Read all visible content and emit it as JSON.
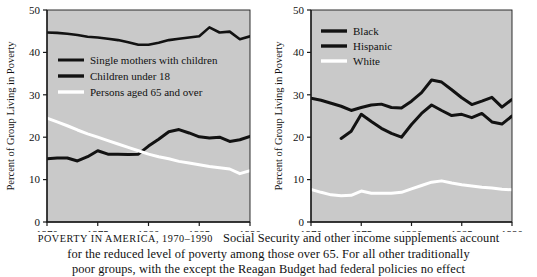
{
  "caption": {
    "title": "Poverty in America, 1970–1990",
    "line1_rest": "Social Security and other income supplements account",
    "line2": "for the reduced level of poverty among those over 65. For all other traditionally",
    "line3": "poor groups, with the except the Reagan Budget had federal policies no effect"
  },
  "colors": {
    "plot_background": "#c9c9c9",
    "axis": "#1a1a1a",
    "dark_series": "#121212",
    "light_series": "#ffffff",
    "page_background": "#ffffff"
  },
  "chart_data": [
    {
      "id": "left",
      "type": "line",
      "title": "",
      "xlabel": "",
      "ylabel": "Percent of Group Living in Poverty",
      "xlim": [
        1970,
        1990
      ],
      "ylim": [
        0,
        50
      ],
      "xticks": [
        1970,
        1975,
        1980,
        1985,
        1990
      ],
      "yticks": [
        0,
        10,
        20,
        30,
        40,
        50
      ],
      "grid": false,
      "legend_position": "upper-left-inside",
      "series": [
        {
          "name": "Single mothers with children",
          "color": "#121212",
          "width": 2.6,
          "x": [
            1970,
            1971,
            1972,
            1973,
            1974,
            1975,
            1976,
            1977,
            1978,
            1979,
            1980,
            1981,
            1982,
            1983,
            1984,
            1985,
            1986,
            1987,
            1988,
            1989,
            1990
          ],
          "values": [
            44.7,
            44.6,
            44.4,
            44.1,
            43.7,
            43.5,
            43.2,
            42.9,
            42.4,
            41.8,
            41.8,
            42.3,
            42.9,
            43.2,
            43.5,
            43.8,
            45.9,
            44.7,
            44.9,
            43.1,
            43.8
          ]
        },
        {
          "name": "Children under 18",
          "color": "#121212",
          "width": 3.0,
          "x": [
            1970,
            1971,
            1972,
            1973,
            1974,
            1975,
            1976,
            1977,
            1978,
            1979,
            1980,
            1981,
            1982,
            1983,
            1984,
            1985,
            1986,
            1987,
            1988,
            1989,
            1990
          ],
          "values": [
            14.9,
            15.1,
            15.1,
            14.4,
            15.4,
            16.8,
            16.0,
            16.0,
            15.9,
            16.0,
            17.9,
            19.5,
            21.3,
            21.8,
            21.0,
            20.1,
            19.8,
            20.0,
            19.0,
            19.4,
            20.2
          ]
        },
        {
          "name": "Persons aged 65 and over",
          "color": "#ffffff",
          "width": 3.0,
          "x": [
            1970,
            1971,
            1972,
            1973,
            1974,
            1975,
            1976,
            1977,
            1978,
            1979,
            1980,
            1981,
            1982,
            1983,
            1984,
            1985,
            1986,
            1987,
            1988,
            1989,
            1990
          ],
          "values": [
            24.5,
            23.6,
            22.7,
            21.7,
            20.8,
            20.0,
            19.2,
            18.4,
            17.6,
            16.8,
            16.0,
            15.4,
            14.9,
            14.3,
            13.9,
            13.5,
            13.1,
            12.8,
            12.5,
            11.4,
            12.1
          ]
        }
      ]
    },
    {
      "id": "right",
      "type": "line",
      "title": "",
      "xlabel": "",
      "ylabel": "Percent of Group Living in Poverty",
      "xlim": [
        1970,
        1990
      ],
      "ylim": [
        0,
        50
      ],
      "xticks": [
        1970,
        1975,
        1980,
        1985,
        1990
      ],
      "yticks": [
        0,
        10,
        20,
        30,
        40,
        50
      ],
      "grid": false,
      "legend_position": "upper-left-inside",
      "series": [
        {
          "name": "Black",
          "color": "#121212",
          "width": 3.0,
          "x": [
            1970,
            1971,
            1972,
            1973,
            1974,
            1975,
            1976,
            1977,
            1978,
            1979,
            1980,
            1981,
            1982,
            1983,
            1984,
            1985,
            1986,
            1987,
            1988,
            1989,
            1990
          ],
          "values": [
            29.2,
            28.7,
            28.0,
            27.3,
            26.3,
            27.0,
            27.6,
            27.8,
            27.0,
            26.9,
            28.5,
            30.5,
            33.5,
            33.0,
            31.2,
            29.3,
            27.7,
            28.5,
            29.4,
            27.1,
            28.9
          ]
        },
        {
          "name": "Hispanic",
          "color": "#121212",
          "width": 3.0,
          "x": [
            1973,
            1974,
            1975,
            1976,
            1977,
            1978,
            1979,
            1980,
            1981,
            1982,
            1983,
            1984,
            1985,
            1986,
            1987,
            1988,
            1989,
            1990
          ],
          "values": [
            19.7,
            21.4,
            25.4,
            23.7,
            22.1,
            20.9,
            20.0,
            23.0,
            25.6,
            27.6,
            26.3,
            25.1,
            25.4,
            24.6,
            25.6,
            23.6,
            23.1,
            25.0
          ]
        },
        {
          "name": "White",
          "color": "#ffffff",
          "width": 3.0,
          "x": [
            1970,
            1971,
            1972,
            1973,
            1974,
            1975,
            1976,
            1977,
            1978,
            1979,
            1980,
            1981,
            1982,
            1983,
            1984,
            1985,
            1986,
            1987,
            1988,
            1989,
            1990
          ],
          "values": [
            7.7,
            7.0,
            6.4,
            6.2,
            6.3,
            7.3,
            6.8,
            6.8,
            6.8,
            7.0,
            7.8,
            8.6,
            9.4,
            9.7,
            9.2,
            8.8,
            8.5,
            8.2,
            8.0,
            7.7,
            7.6
          ]
        }
      ]
    }
  ]
}
